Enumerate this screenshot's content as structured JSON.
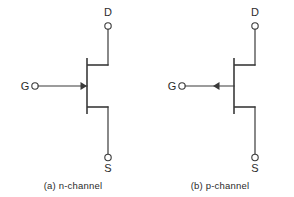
{
  "figure": {
    "background_color": "#ffffff",
    "line_color": "#3a3a3a",
    "text_color": "#2b2b2b",
    "width": 294,
    "height": 197
  },
  "symbols": [
    {
      "id": "n-channel",
      "caption": "(a)  n-channel",
      "caption_index": "(a)",
      "caption_name": "n-channel",
      "arrow_direction": "in",
      "terminals": {
        "drain": "D",
        "gate": "G",
        "source": "S"
      }
    },
    {
      "id": "p-channel",
      "caption": "(b)  p-channel",
      "caption_index": "(b)",
      "caption_name": "p-channel",
      "arrow_direction": "out",
      "terminals": {
        "drain": "D",
        "gate": "G",
        "source": "S"
      }
    }
  ]
}
